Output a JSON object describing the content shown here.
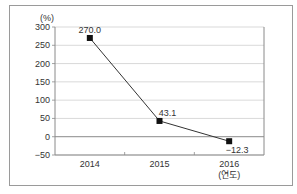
{
  "chart_data": {
    "type": "line",
    "title": "",
    "xlabel": "(연도)",
    "ylabel": "(%)",
    "categories": [
      "2014",
      "2015",
      "2016"
    ],
    "series": [
      {
        "name": "",
        "values": [
          270.0,
          43.1,
          -12.3
        ]
      }
    ],
    "data_labels": [
      "270.0",
      "43.1",
      "−12.3"
    ],
    "yticks": [
      "300",
      "250",
      "200",
      "150",
      "100",
      "50",
      "0",
      "−50"
    ],
    "ylim": [
      -50,
      300
    ],
    "grid": true,
    "legend": "none"
  },
  "colors": {
    "line": "#333333",
    "marker": "#111111",
    "grid": "#cfcfcf",
    "axis": "#8a8a8a",
    "frame": "#9a9a9a"
  }
}
